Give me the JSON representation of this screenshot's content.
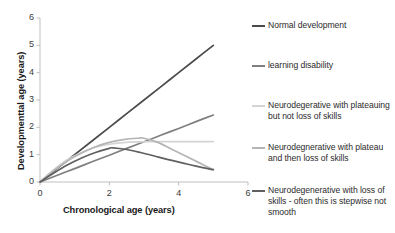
{
  "chart_data": {
    "type": "line",
    "title": "",
    "xlabel": "Chronological age (years)",
    "ylabel": "Developmenttal age (years)",
    "xlim": [
      0,
      6
    ],
    "ylim": [
      0,
      6
    ],
    "xticks": [
      "0",
      "2",
      "4",
      "6"
    ],
    "xtick_values": [
      0,
      2,
      4,
      6
    ],
    "yticks": [
      "0",
      "1",
      "2",
      "3",
      "4",
      "5",
      "6"
    ],
    "ytick_values": [
      0,
      1,
      2,
      3,
      4,
      5,
      6
    ],
    "grid": false,
    "legend_position": "right",
    "series": [
      {
        "name": "Normal development",
        "color": "#4a4a4a",
        "x": [
          0,
          0.5,
          1,
          1.5,
          2,
          2.5,
          3,
          3.5,
          4,
          4.5,
          5
        ],
        "values": [
          0,
          0.5,
          1.0,
          1.5,
          2.0,
          2.5,
          3.0,
          3.5,
          4.0,
          4.5,
          5.0
        ]
      },
      {
        "name": "learning disability",
        "color": "#7f7f7f",
        "x": [
          0,
          0.5,
          1,
          1.5,
          2,
          2.5,
          3,
          3.5,
          4,
          4.5,
          5
        ],
        "values": [
          0,
          0.25,
          0.49,
          0.74,
          0.98,
          1.23,
          1.47,
          1.72,
          1.96,
          2.21,
          2.45
        ]
      },
      {
        "name": "Neurodegerative with plateauing but not loss of skills",
        "color": "#d4d4d4",
        "x": [
          0,
          0.4,
          0.8,
          1.2,
          1.6,
          2.0,
          2.4,
          2.8,
          3.2,
          3.6,
          4.0,
          4.4,
          5.0
        ],
        "values": [
          0,
          0.45,
          0.82,
          1.08,
          1.27,
          1.38,
          1.44,
          1.47,
          1.48,
          1.48,
          1.48,
          1.48,
          1.48
        ]
      },
      {
        "name": "Neurodegnerative with plateau and then loss of skills",
        "color": "#b5b5b5",
        "x": [
          0,
          0.4,
          0.8,
          1.2,
          1.6,
          2.0,
          2.4,
          2.8,
          3.0,
          3.4,
          3.8,
          4.2,
          4.6,
          5.0
        ],
        "values": [
          0,
          0.42,
          0.78,
          1.06,
          1.29,
          1.45,
          1.55,
          1.6,
          1.6,
          1.45,
          1.2,
          0.95,
          0.7,
          0.45
        ]
      },
      {
        "name": "Neurodegenerative with loss of skills - often this is stepwise not smooth",
        "color": "#606060",
        "x": [
          0,
          0.4,
          0.8,
          1.2,
          1.6,
          2.0,
          2.1,
          2.5,
          2.9,
          3.3,
          3.7,
          4.1,
          4.5,
          5.0
        ],
        "values": [
          0,
          0.33,
          0.63,
          0.88,
          1.08,
          1.23,
          1.25,
          1.19,
          1.08,
          0.95,
          0.82,
          0.7,
          0.58,
          0.45
        ]
      }
    ]
  },
  "legend": {
    "items": [
      {
        "label": "Normal development",
        "color": "#4a4a4a"
      },
      {
        "label": "learning disability",
        "color": "#7f7f7f"
      },
      {
        "label": "Neurodegerative with plateauing but not loss of skills",
        "color": "#d4d4d4"
      },
      {
        "label": "Neurodegnerative with plateau and then loss of skills",
        "color": "#b5b5b5"
      },
      {
        "label": "Neurodegenerative with loss of skills - often this is stepwise not smooth",
        "color": "#606060"
      }
    ]
  },
  "axes": {
    "x_title": "Chronological age (years)",
    "y_title": "Developmenttal age (years)",
    "x_tick_labels": [
      "0",
      "2",
      "4",
      "6"
    ],
    "y_tick_labels": [
      "0",
      "1",
      "2",
      "3",
      "4",
      "5",
      "6"
    ],
    "axis_color": "#bfbfbf"
  }
}
